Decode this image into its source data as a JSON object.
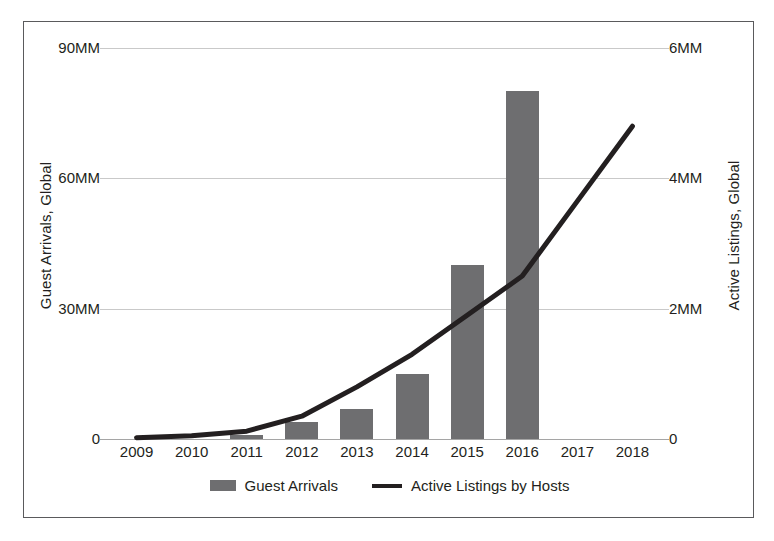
{
  "chart_data": {
    "type": "bar",
    "title": "",
    "xlabel": "",
    "ylabel": "Guest Arrivals, Global",
    "y2label": "Active Listings, Global",
    "categories": [
      "2009",
      "2010",
      "2011",
      "2012",
      "2013",
      "2014",
      "2015",
      "2016",
      "2017",
      "2018"
    ],
    "grid": true,
    "legend_position": "bottom",
    "ylim": [
      0,
      90
    ],
    "yticks": [
      0,
      30,
      60,
      90
    ],
    "ytick_labels": [
      "0",
      "30MM",
      "60MM",
      "90MM"
    ],
    "y2lim": [
      0,
      6
    ],
    "y2ticks": [
      0,
      2,
      4,
      6
    ],
    "y2tick_labels": [
      "0",
      "2MM",
      "4MM",
      "6MM"
    ],
    "series": [
      {
        "name": "Guest Arrivals",
        "type": "bar",
        "axis": "left",
        "units": "MM",
        "color": "#6e6e70",
        "values": [
          0,
          0,
          1,
          4,
          7,
          15,
          40,
          80,
          null,
          null
        ]
      },
      {
        "name": "Active Listings by Hosts",
        "type": "line",
        "axis": "right",
        "units": "MM",
        "color": "#231f20",
        "values": [
          0.02,
          0.05,
          0.12,
          0.35,
          0.8,
          1.3,
          1.9,
          2.5,
          3.65,
          4.8
        ]
      }
    ]
  },
  "legend": {
    "items": [
      {
        "label": "Guest Arrivals",
        "marker": "bar-swatch"
      },
      {
        "label": "Active Listings by Hosts",
        "marker": "line-swatch"
      }
    ]
  }
}
